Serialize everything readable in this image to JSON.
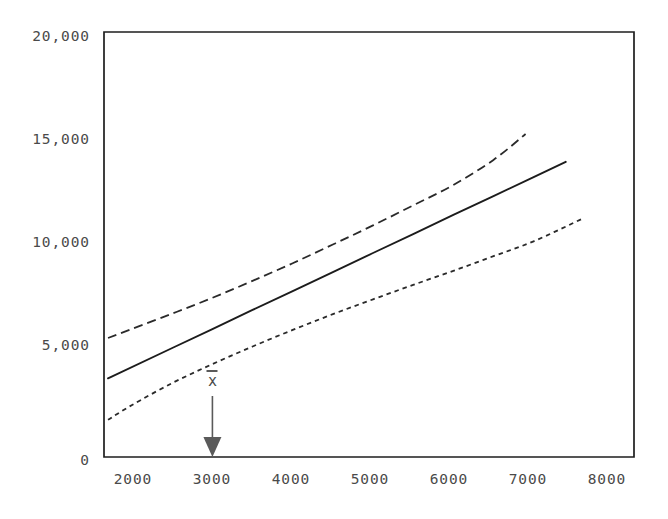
{
  "chart_data": {
    "type": "line",
    "title": "",
    "xlabel": "",
    "ylabel": "",
    "xlim": [
      1650,
      8250
    ],
    "ylim": [
      0,
      20000
    ],
    "grid": false,
    "legend": null,
    "y_ticks": [
      {
        "value": 20000,
        "label": "20,000"
      },
      {
        "value": 15000,
        "label": "15,000"
      },
      {
        "value": 10000,
        "label": "10,000"
      },
      {
        "value": 5000,
        "label": "5,000"
      },
      {
        "value": 0,
        "label": "0"
      }
    ],
    "x_ticks": [
      {
        "value": 2000,
        "label": "2000"
      },
      {
        "value": 3000,
        "label": "3000"
      },
      {
        "value": 4000,
        "label": "4000"
      },
      {
        "value": 5000,
        "label": "5000"
      },
      {
        "value": 6000,
        "label": "6000"
      },
      {
        "value": 7000,
        "label": "7000"
      },
      {
        "value": 8000,
        "label": "8000"
      }
    ],
    "series": [
      {
        "name": "regression-line",
        "style": "solid",
        "color": "#1c1c1c",
        "points": [
          [
            1700,
            3700
          ],
          [
            2500,
            5130
          ],
          [
            3000,
            6020
          ],
          [
            3500,
            6920
          ],
          [
            4000,
            7810
          ],
          [
            4500,
            8700
          ],
          [
            5000,
            9600
          ],
          [
            5500,
            10490
          ],
          [
            6000,
            11390
          ],
          [
            6500,
            12280
          ],
          [
            7000,
            13170
          ],
          [
            7400,
            13890
          ]
        ]
      },
      {
        "name": "upper-confidence-band",
        "style": "dashed",
        "color": "#2a2a2a",
        "points": [
          [
            1700,
            5600
          ],
          [
            2000,
            6030
          ],
          [
            2500,
            6750
          ],
          [
            3000,
            7490
          ],
          [
            3500,
            8290
          ],
          [
            4000,
            9120
          ],
          [
            4500,
            10000
          ],
          [
            5000,
            10900
          ],
          [
            5500,
            11840
          ],
          [
            6000,
            12800
          ],
          [
            6500,
            13980
          ],
          [
            6900,
            15200
          ]
        ]
      },
      {
        "name": "lower-confidence-band",
        "style": "dotted",
        "color": "#2a2a2a",
        "points": [
          [
            1700,
            1750
          ],
          [
            2000,
            2450
          ],
          [
            2500,
            3480
          ],
          [
            3000,
            4370
          ],
          [
            3500,
            5200
          ],
          [
            4000,
            5980
          ],
          [
            4500,
            6720
          ],
          [
            5000,
            7420
          ],
          [
            5500,
            8100
          ],
          [
            6000,
            8760
          ],
          [
            6500,
            9450
          ],
          [
            7000,
            10150
          ],
          [
            7600,
            11200
          ]
        ]
      }
    ],
    "annotations": [
      {
        "name": "mean-x-marker",
        "label": "x",
        "overbar": true,
        "x_value": 3000,
        "kind": "down-arrow",
        "color": "#5a5a5a"
      }
    ]
  }
}
